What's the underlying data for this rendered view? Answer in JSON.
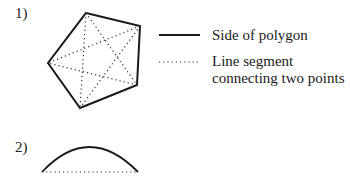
{
  "figure1": {
    "number_label": "1)",
    "polygon": {
      "type": "pentagon",
      "vertices": [
        [
          86,
          13
        ],
        [
          140,
          26
        ],
        [
          137,
          85
        ],
        [
          80,
          108
        ],
        [
          48,
          63
        ]
      ]
    },
    "legend": [
      {
        "style": "solid",
        "label": "Side of polygon"
      },
      {
        "style": "dotted",
        "label_line1": "Line segment",
        "label_line2": "connecting two points"
      }
    ]
  },
  "figure2": {
    "number_label": "2)",
    "arc": "circular arc above dotted chord"
  },
  "colors": {
    "stroke": "#1a1a1a",
    "background": "#ffffff"
  }
}
